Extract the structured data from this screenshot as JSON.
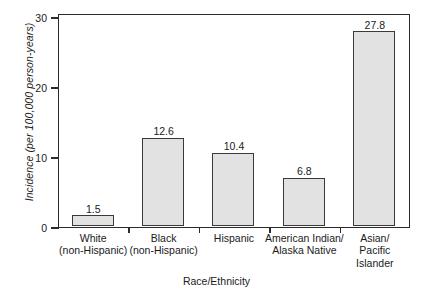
{
  "chart_data": {
    "type": "bar",
    "title": "",
    "xlabel": "Race/Ethnicity",
    "ylabel": "Incidence (per 100,000 person-years)",
    "categories": [
      "White (non-Hispanic)",
      "Black (non-Hispanic)",
      "Hispanic",
      "American Indian/ Alaska Native",
      "Asian/ Pacific Islander"
    ],
    "category_lines": [
      [
        "White",
        "(non-Hispanic)"
      ],
      [
        "Black",
        "(non-Hispanic)"
      ],
      [
        "Hispanic"
      ],
      [
        "American Indian/",
        "Alaska Native"
      ],
      [
        "Asian/",
        "Pacific",
        "Islander"
      ]
    ],
    "values": [
      1.5,
      12.6,
      10.4,
      6.8,
      27.8
    ],
    "value_labels": [
      "1.5",
      "12.6",
      "10.4",
      "6.8",
      "27.8"
    ],
    "ylim": [
      0,
      30.6
    ],
    "yticks": [
      0,
      10,
      20,
      30
    ],
    "ytick_labels": [
      "0",
      "10",
      "20",
      "30"
    ],
    "grid": false,
    "legend": null,
    "bar_fill_color": "#e2e2e2",
    "bar_edge_color": "#3a3a3a",
    "axis_color": "#2b2b2b",
    "text_color": "#1a1a1a"
  }
}
